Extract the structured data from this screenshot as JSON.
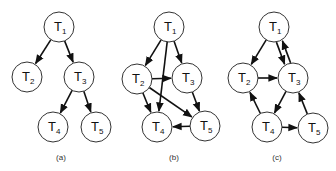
{
  "diagram": {
    "node_radius": 15,
    "colors": {
      "stroke": "#333333",
      "edge": "#111111",
      "fill": "#ffffff"
    },
    "graphs": [
      {
        "id": "a",
        "caption": "(a)",
        "caption_pos": [
          61,
          160
        ],
        "nodes": [
          {
            "id": "T1",
            "label": "T",
            "sub": "1",
            "x": 59,
            "y": 27
          },
          {
            "id": "T2",
            "label": "T",
            "sub": "2",
            "x": 27,
            "y": 77
          },
          {
            "id": "T3",
            "label": "T",
            "sub": "3",
            "x": 79,
            "y": 77
          },
          {
            "id": "T4",
            "label": "T",
            "sub": "4",
            "x": 53,
            "y": 127
          },
          {
            "id": "T5",
            "label": "T",
            "sub": "5",
            "x": 96,
            "y": 127
          }
        ],
        "edges": [
          {
            "from": "T1",
            "to": "T2"
          },
          {
            "from": "T1",
            "to": "T3"
          },
          {
            "from": "T3",
            "to": "T4"
          },
          {
            "from": "T3",
            "to": "T5"
          }
        ]
      },
      {
        "id": "b",
        "caption": "(b)",
        "caption_pos": [
          174,
          160
        ],
        "nodes": [
          {
            "id": "T1",
            "label": "T",
            "sub": "1",
            "x": 169,
            "y": 27
          },
          {
            "id": "T2",
            "label": "T",
            "sub": "2",
            "x": 137,
            "y": 79
          },
          {
            "id": "T3",
            "label": "T",
            "sub": "3",
            "x": 187,
            "y": 78
          },
          {
            "id": "T4",
            "label": "T",
            "sub": "4",
            "x": 157,
            "y": 127
          },
          {
            "id": "T5",
            "label": "T",
            "sub": "5",
            "x": 205,
            "y": 126
          }
        ],
        "edges": [
          {
            "from": "T1",
            "to": "T2"
          },
          {
            "from": "T1",
            "to": "T3"
          },
          {
            "from": "T1",
            "to": "T4"
          },
          {
            "from": "T2",
            "to": "T3"
          },
          {
            "from": "T2",
            "to": "T4"
          },
          {
            "from": "T2",
            "to": "T5"
          },
          {
            "from": "T3",
            "to": "T5"
          },
          {
            "from": "T5",
            "to": "T4"
          }
        ]
      },
      {
        "id": "c",
        "caption": "(c)",
        "caption_pos": [
          277,
          160
        ],
        "nodes": [
          {
            "id": "T1",
            "label": "T",
            "sub": "1",
            "x": 274,
            "y": 27
          },
          {
            "id": "T2",
            "label": "T",
            "sub": "2",
            "x": 243,
            "y": 78
          },
          {
            "id": "T3",
            "label": "T",
            "sub": "3",
            "x": 293,
            "y": 78
          },
          {
            "id": "T4",
            "label": "T",
            "sub": "4",
            "x": 267,
            "y": 127
          },
          {
            "id": "T5",
            "label": "T",
            "sub": "5",
            "x": 313,
            "y": 128
          }
        ],
        "edges": [
          {
            "from": "T1",
            "to": "T2"
          },
          {
            "from": "T1",
            "to": "T3",
            "offset": 3
          },
          {
            "from": "T3",
            "to": "T1",
            "offset": 3
          },
          {
            "from": "T2",
            "to": "T3"
          },
          {
            "from": "T3",
            "to": "T4"
          },
          {
            "from": "T4",
            "to": "T2"
          },
          {
            "from": "T4",
            "to": "T5"
          },
          {
            "from": "T5",
            "to": "T3"
          }
        ]
      }
    ]
  }
}
